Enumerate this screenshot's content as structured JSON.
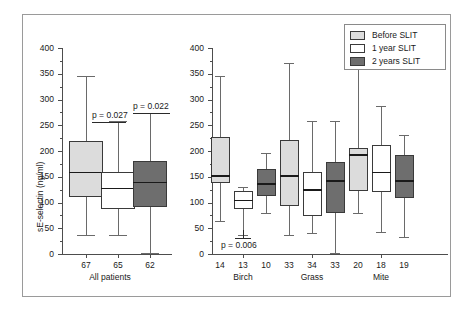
{
  "figure": {
    "ylabel": "sE-selectin (ng/ml)",
    "y_ticks": [
      "400",
      "350",
      "300",
      "250",
      "200",
      "150",
      "100",
      "50",
      "0"
    ]
  },
  "legend": {
    "items": [
      {
        "label": "Before SLIT",
        "color": "#dcdcdc"
      },
      {
        "label": "1 year SLIT",
        "color": "#ffffff"
      },
      {
        "label": "2 years SLIT",
        "color": "#6e6e6e"
      }
    ]
  },
  "annotations": {
    "p1": "p = 0.027",
    "p2": "p = 0.022",
    "p3": "p = 0.006"
  },
  "groups": {
    "all_patients": "All patients",
    "birch": "Birch",
    "grass": "Grass",
    "mite": "Mite"
  },
  "counts": {
    "all_patients": [
      "67",
      "65",
      "62"
    ],
    "birch": [
      "14",
      "13",
      "10"
    ],
    "grass": [
      "33",
      "34",
      "33"
    ],
    "mite": [
      "20",
      "18",
      "19"
    ]
  },
  "chart_data": {
    "type": "box",
    "title": "",
    "xlabel": "",
    "ylabel": "sE-selectin (ng/ml)",
    "ylim": [
      0,
      400
    ],
    "ytick_step": 50,
    "yminor_step": 25,
    "grid": false,
    "legend_position": "top-right",
    "series_names": [
      "Before SLIT",
      "1 year SLIT",
      "2 years SLIT"
    ],
    "series_colors": [
      "#dcdcdc",
      "#ffffff",
      "#6e6e6e"
    ],
    "panels": [
      {
        "name": "All patients",
        "groups": [
          {
            "category": "All patients",
            "n": [
              67,
              65,
              62
            ],
            "boxes": [
              {
                "series": "Before SLIT",
                "n": 67,
                "min": 37,
                "q1": 110,
                "median": 158,
                "q3": 219,
                "max": 345
              },
              {
                "series": "1 year SLIT",
                "n": 65,
                "min": 37,
                "q1": 88,
                "median": 127,
                "q3": 160,
                "max": 258
              },
              {
                "series": "2 years SLIT",
                "n": 62,
                "min": 2,
                "q1": 91,
                "median": 139,
                "q3": 180,
                "max": 273
              }
            ]
          }
        ],
        "annotations": [
          {
            "text": "p = 0.027",
            "compares": [
              "Before SLIT",
              "1 year SLIT"
            ]
          },
          {
            "text": "p = 0.022",
            "compares": [
              "Before SLIT",
              "2 years SLIT"
            ]
          }
        ]
      },
      {
        "name": "Allergen subgroups",
        "groups": [
          {
            "category": "Birch",
            "n": [
              14,
              13,
              10
            ],
            "boxes": [
              {
                "series": "Before SLIT",
                "n": 14,
                "min": 65,
                "q1": 137,
                "median": 152,
                "q3": 227,
                "max": 345
              },
              {
                "series": "1 year SLIT",
                "n": 13,
                "min": 37,
                "q1": 87,
                "median": 104,
                "q3": 122,
                "max": 130
              },
              {
                "series": "2 years SLIT",
                "n": 10,
                "min": 80,
                "q1": 112,
                "median": 136,
                "q3": 166,
                "max": 196
              }
            ]
          },
          {
            "category": "Grass",
            "n": [
              33,
              34,
              33
            ],
            "boxes": [
              {
                "series": "Before SLIT",
                "n": 33,
                "min": 37,
                "q1": 93,
                "median": 152,
                "q3": 222,
                "max": 370
              },
              {
                "series": "1 year SLIT",
                "n": 34,
                "min": 40,
                "q1": 74,
                "median": 124,
                "q3": 160,
                "max": 258
              },
              {
                "series": "2 years SLIT",
                "n": 33,
                "min": 2,
                "q1": 80,
                "median": 142,
                "q3": 178,
                "max": 258
              }
            ]
          },
          {
            "category": "Mite",
            "n": [
              20,
              18,
              19
            ],
            "boxes": [
              {
                "series": "Before SLIT",
                "n": 20,
                "min": 80,
                "q1": 123,
                "median": 192,
                "q3": 206,
                "max": 370
              },
              {
                "series": "1 year SLIT",
                "n": 18,
                "min": 43,
                "q1": 120,
                "median": 158,
                "q3": 212,
                "max": 288
              },
              {
                "series": "2 years SLIT",
                "n": 19,
                "min": 33,
                "q1": 108,
                "median": 142,
                "q3": 192,
                "max": 232
              }
            ]
          }
        ],
        "annotations": [
          {
            "text": "p = 0.006",
            "compares": [
              "Before SLIT",
              "1 year SLIT"
            ],
            "category": "Birch"
          }
        ]
      }
    ]
  }
}
